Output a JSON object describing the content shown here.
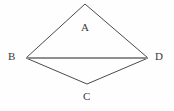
{
  "figure": {
    "type": "geometry-diagram",
    "shape_name": "rhombus",
    "background_color": "#fefefe",
    "canvas": {
      "width": 174,
      "height": 111
    },
    "outline": {
      "color": "#4a4a4a",
      "width": 1,
      "fill": "none"
    },
    "diagonal": {
      "color": "#8f8f8f",
      "width": 2.2
    },
    "vertices": [
      {
        "id": "top",
        "x": 85,
        "y": 4
      },
      {
        "id": "right",
        "x": 148,
        "y": 58
      },
      {
        "id": "bottom",
        "x": 87,
        "y": 84
      },
      {
        "id": "left",
        "x": 26,
        "y": 58
      }
    ],
    "edges": [
      {
        "from": "top",
        "to": "right"
      },
      {
        "from": "right",
        "to": "bottom"
      },
      {
        "from": "bottom",
        "to": "left"
      },
      {
        "from": "left",
        "to": "top"
      }
    ],
    "diagonal_segment": {
      "from": "left",
      "to": "right"
    },
    "labels": {
      "a": "A",
      "b": "B",
      "c": "C",
      "d": "D"
    },
    "label_color": "#3a3a3a"
  }
}
